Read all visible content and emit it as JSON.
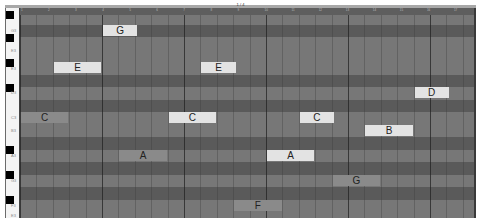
{
  "window": {
    "title": "1 / 4"
  },
  "ruler": {
    "ticks": [
      "1",
      "2",
      "3",
      "4",
      "5",
      "6",
      "7",
      "8",
      "9",
      "10",
      "11",
      "12",
      "13",
      "14",
      "15",
      "16",
      "17"
    ]
  },
  "keyboard": {
    "labels": [
      "G3",
      "E3",
      "E3",
      "D3",
      "C3",
      "B3",
      "A3",
      "G3",
      "F3",
      "E3"
    ]
  },
  "colors": {
    "note_light": "#e3e3e3",
    "note_mid": "#8a8a8a",
    "row_light": "#777777",
    "row_dark": "#5a5a5a"
  },
  "notes": [
    {
      "name": "G",
      "pitch": "G",
      "start_beat": 5,
      "length_beats": 2,
      "selected": true
    },
    {
      "name": "E",
      "pitch": "E",
      "start_beat": 2,
      "length_beats": 3,
      "selected": true
    },
    {
      "name": "E",
      "pitch": "E",
      "start_beat": 11,
      "length_beats": 2,
      "selected": true
    },
    {
      "name": "D",
      "pitch": "D",
      "start_beat": 24,
      "length_beats": 2,
      "selected": true
    },
    {
      "name": "C",
      "pitch": "C",
      "start_beat": 0,
      "length_beats": 3,
      "selected": false
    },
    {
      "name": "C",
      "pitch": "C",
      "start_beat": 9,
      "length_beats": 3,
      "selected": true
    },
    {
      "name": "C",
      "pitch": "C",
      "start_beat": 17,
      "length_beats": 2,
      "selected": true
    },
    {
      "name": "B",
      "pitch": "B",
      "start_beat": 21,
      "length_beats": 3,
      "selected": true
    },
    {
      "name": "A",
      "pitch": "A",
      "start_beat": 6,
      "length_beats": 3,
      "selected": false
    },
    {
      "name": "A",
      "pitch": "A",
      "start_beat": 15,
      "length_beats": 3,
      "selected": true
    },
    {
      "name": "G",
      "pitch": "G",
      "start_beat": 19,
      "length_beats": 3,
      "selected": false
    },
    {
      "name": "F",
      "pitch": "F",
      "start_beat": 13,
      "length_beats": 3,
      "selected": false
    }
  ]
}
